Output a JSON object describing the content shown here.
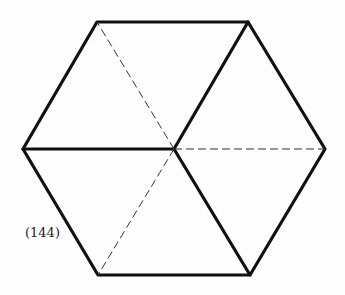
{
  "figure": {
    "label": "(144)",
    "vertices": {
      "top_left": [
        97,
        22
      ],
      "top_right": [
        248,
        22
      ],
      "right": [
        325,
        149
      ],
      "bottom_right": [
        250,
        275
      ],
      "bottom_left": [
        98,
        275
      ],
      "left": [
        23,
        149
      ],
      "center": [
        174,
        149
      ]
    },
    "solid_internal_edges": [
      "center-top_right",
      "center-left",
      "center-bottom_right"
    ],
    "dashed_internal_edges": [
      "center-top_left",
      "center-right",
      "center-bottom_left"
    ],
    "colors": {
      "stroke": "#111111",
      "background": "#fdfdfd"
    }
  }
}
